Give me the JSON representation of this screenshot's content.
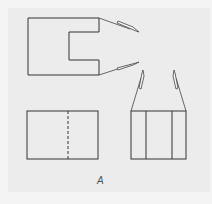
{
  "figure": {
    "label": "A",
    "views": [
      {
        "name": "top-view",
        "shape": "rectangle with notch on right side"
      },
      {
        "name": "front-view",
        "shape": "rectangle with hidden center line"
      },
      {
        "name": "side-view",
        "shape": "rectangle with two vertical lines"
      }
    ],
    "line_color": "#333333",
    "arrow_count": 4
  }
}
